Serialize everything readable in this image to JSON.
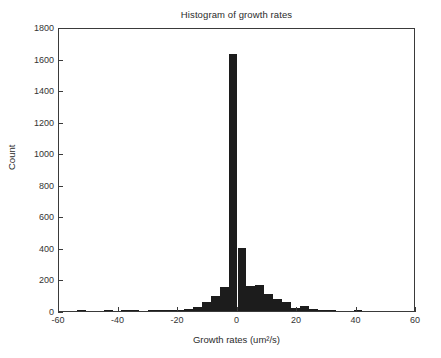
{
  "chart_data": {
    "type": "bar",
    "title": "Histogram of growth rates",
    "xlabel": "Growth rates (um²/s)",
    "ylabel": "Count",
    "xlim": [
      -60,
      60
    ],
    "ylim": [
      0,
      1800
    ],
    "xticks": [
      -60,
      -40,
      -20,
      0,
      20,
      40,
      60
    ],
    "xtick_labels": [
      "-60",
      "-40",
      "-20",
      "0",
      "20",
      "40",
      "60"
    ],
    "yticks": [
      0,
      200,
      400,
      600,
      800,
      1000,
      1200,
      1400,
      1600,
      1800
    ],
    "ytick_labels": [
      "0",
      "200",
      "400",
      "600",
      "800",
      "1000",
      "1200",
      "1400",
      "1600",
      "1800"
    ],
    "grid": false,
    "legend": null,
    "bar_color": "#1c1c1c",
    "bin_width": 3,
    "bin_centers": [
      -55.5,
      -52.5,
      -49.5,
      -46.5,
      -43.5,
      -40.5,
      -37.5,
      -34.5,
      -31.5,
      -28.5,
      -25.5,
      -22.5,
      -19.5,
      -16.5,
      -13.5,
      -10.5,
      -7.5,
      -4.5,
      -1.5,
      1.5,
      4.5,
      7.5,
      10.5,
      13.5,
      16.5,
      19.5,
      22.5,
      25.5,
      28.5,
      31.5,
      34.5,
      37.5,
      40.5,
      43.5,
      46.5,
      49.5
    ],
    "values": [
      0,
      4,
      0,
      0,
      3,
      0,
      5,
      4,
      0,
      6,
      3,
      5,
      9,
      14,
      26,
      55,
      96,
      155,
      1630,
      400,
      160,
      165,
      110,
      78,
      60,
      22,
      30,
      10,
      6,
      4,
      0,
      0,
      9,
      0,
      0,
      0
    ]
  },
  "peak": {
    "center": -1.5,
    "count": 1630
  }
}
